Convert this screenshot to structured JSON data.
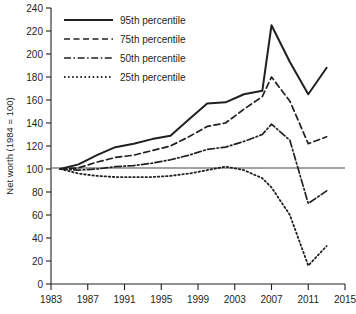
{
  "chart_data": {
    "type": "line",
    "title": "",
    "xlabel": "",
    "ylabel": "Net worth (1984 = 100)",
    "xlim": [
      1983,
      2015
    ],
    "ylim": [
      0,
      240
    ],
    "xticks": [
      "1983",
      "1987",
      "1991",
      "1995",
      "1999",
      "2003",
      "2007",
      "2011",
      "2015"
    ],
    "yticks": [
      "0",
      "20",
      "40",
      "60",
      "80",
      "100",
      "120",
      "140",
      "160",
      "180",
      "200",
      "220",
      "240"
    ],
    "grid": false,
    "reference_line": 100,
    "legend_position": "top-left",
    "x": [
      1984,
      1986,
      1988,
      1990,
      1992,
      1994,
      1996,
      1998,
      2000,
      2002,
      2004,
      2006,
      2007,
      2009,
      2011,
      2013
    ],
    "series": [
      {
        "name": "95th percentile",
        "style": "solid",
        "values": [
          100,
          104,
          112,
          119,
          122,
          126,
          129,
          143,
          157,
          158,
          165,
          168,
          225,
          193,
          165,
          188
        ]
      },
      {
        "name": "75th percentile",
        "style": "dashed",
        "values": [
          100,
          101,
          106,
          110,
          112,
          116,
          120,
          128,
          137,
          140,
          152,
          163,
          180,
          159,
          122,
          128
        ]
      },
      {
        "name": "50th percentile",
        "style": "dashdot",
        "values": [
          100,
          99,
          100,
          102,
          103,
          105,
          108,
          112,
          117,
          119,
          124,
          130,
          139,
          125,
          70,
          81
        ]
      },
      {
        "name": "25th percentile",
        "style": "dotted",
        "values": [
          100,
          96,
          94,
          93,
          93,
          93,
          94,
          96,
          99,
          102,
          99,
          92,
          84,
          60,
          16,
          33
        ]
      }
    ]
  },
  "legend": {
    "items": [
      {
        "label": "95th percentile",
        "style": "solid"
      },
      {
        "label": "75th percentile",
        "style": "dashed"
      },
      {
        "label": "50th percentile",
        "style": "dashdot"
      },
      {
        "label": "25th percentile",
        "style": "dotted"
      }
    ]
  },
  "axes": {
    "y_title": "Net worth (1984 = 100)"
  }
}
